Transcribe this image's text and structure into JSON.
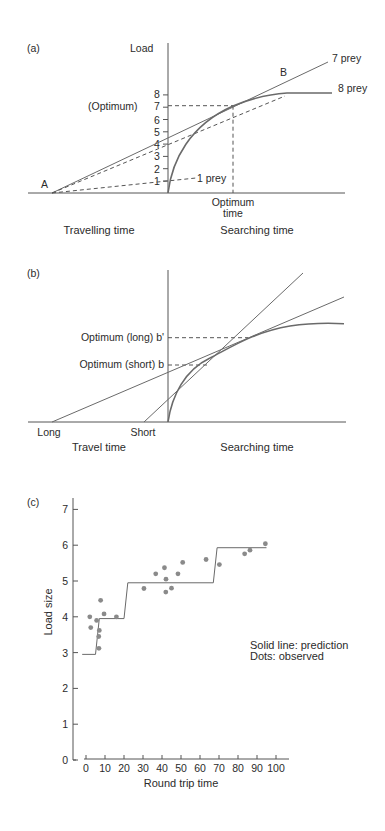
{
  "chart_data": [
    {
      "panel": "(a)",
      "type": "line",
      "title": "",
      "ylabel": "Load",
      "xlabel_left": "Travelling time",
      "xlabel_right": "Searching time",
      "yticks": [
        "1",
        "2",
        "3",
        "4",
        "5",
        "6",
        "7",
        "8"
      ],
      "ylim": [
        0,
        8
      ],
      "annotations": {
        "point_a": "A",
        "point_b": "B",
        "optimum_label": "(Optimum)",
        "optimum_time_line1": "Optimum",
        "optimum_time_line2": "time",
        "line_7prey": "7 prey",
        "line_8prey": "8 prey",
        "line_1prey": "1 prey"
      },
      "series": [
        {
          "name": "Load curve (gain function)",
          "style": "solid-curve",
          "description": "Diminishing-returns load vs searching time, from 0 rising to plateau ~7.8"
        },
        {
          "name": "7 prey",
          "style": "solid",
          "description": "Tangent from A through optimum (load 7)"
        },
        {
          "name": "8 prey",
          "style": "dashed",
          "description": "From A to curve plateau at 8 prey"
        },
        {
          "name": "1 prey",
          "style": "dashed",
          "description": "From A to load 1"
        }
      ],
      "optimum": {
        "load": 7
      }
    },
    {
      "panel": "(b)",
      "type": "line",
      "xlabel_left": "Travel time",
      "xlabel_right": "Searching time",
      "x_points": {
        "long": "Long",
        "short": "Short"
      },
      "annotations": {
        "optimum_long": "Optimum (long) b'",
        "optimum_short": "Optimum (short) b"
      },
      "series": [
        {
          "name": "Gain curve",
          "style": "solid-curve"
        },
        {
          "name": "Tangent from Long travel time",
          "style": "solid"
        },
        {
          "name": "Tangent from Short travel time",
          "style": "solid"
        }
      ]
    },
    {
      "panel": "(c)",
      "type": "scatter",
      "xlabel": "Round trip time",
      "ylabel": "Load size",
      "xlim": [
        0,
        100
      ],
      "ylim": [
        0,
        7
      ],
      "xticks": [
        "0",
        "10",
        "20",
        "30",
        "40",
        "50",
        "60",
        "70",
        "80",
        "90",
        "100"
      ],
      "yticks": [
        "0",
        "1",
        "2",
        "3",
        "4",
        "5",
        "6",
        "7"
      ],
      "legend_text": [
        "Solid line: prediction",
        "Dots: observed"
      ],
      "series": [
        {
          "name": "prediction",
          "style": "step-line",
          "points": [
            [
              -2,
              2.95
            ],
            [
              5,
              2.95
            ],
            [
              7,
              3.95
            ],
            [
              20,
              3.95
            ],
            [
              22,
              4.95
            ],
            [
              67,
              4.95
            ],
            [
              69,
              5.93
            ],
            [
              95,
              5.93
            ]
          ]
        },
        {
          "name": "observed",
          "style": "dots",
          "points": [
            [
              2,
              4.0
            ],
            [
              2.5,
              3.7
            ],
            [
              5.6,
              3.9
            ],
            [
              7.7,
              4.46
            ],
            [
              9.5,
              4.08
            ],
            [
              7,
              3.62
            ],
            [
              6.7,
              3.45
            ],
            [
              6.8,
              3.12
            ],
            [
              16,
              4.0
            ],
            [
              30.5,
              4.79
            ],
            [
              36.7,
              5.2
            ],
            [
              41.3,
              5.37
            ],
            [
              42.1,
              5.05
            ],
            [
              42,
              4.69
            ],
            [
              45,
              4.8
            ],
            [
              48.4,
              5.2
            ],
            [
              50.9,
              5.52
            ],
            [
              63.2,
              5.6
            ],
            [
              70.2,
              5.46
            ],
            [
              83.5,
              5.76
            ],
            [
              86.3,
              5.86
            ],
            [
              94.4,
              6.04
            ]
          ]
        }
      ]
    }
  ]
}
